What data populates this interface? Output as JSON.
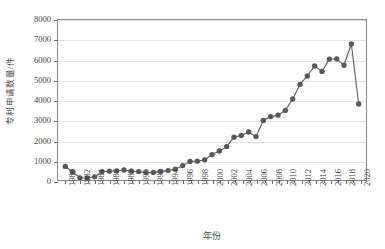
{
  "chart_data": {
    "type": "line",
    "title": "",
    "xlabel": "年份",
    "ylabel": "专利申请数量/件",
    "xlim": [
      1979,
      2021
    ],
    "ylim": [
      0,
      8000
    ],
    "ytick_values": [
      0,
      1000,
      2000,
      3000,
      4000,
      5000,
      6000,
      7000,
      8000
    ],
    "ytick_labels": [
      "0",
      "1000",
      "2000",
      "3000",
      "4000",
      "5000",
      "6000",
      "7000",
      "8000"
    ],
    "xtick_values": [
      1980,
      1982,
      1984,
      1986,
      1988,
      1990,
      1992,
      1994,
      1996,
      1998,
      2000,
      2002,
      2004,
      2006,
      2008,
      2010,
      2012,
      2014,
      2016,
      2018,
      2020
    ],
    "xtick_labels": [
      "1980",
      "1982",
      "1984",
      "1986",
      "1988",
      "1990",
      "1992",
      "1994",
      "1996",
      "1998",
      "2000",
      "2002",
      "2004",
      "2006",
      "2008",
      "2010",
      "2012",
      "2014",
      "2016",
      "2018",
      "2020"
    ],
    "grid": "horizontal",
    "legend": "none",
    "marker": "circle",
    "series_color": "#595959",
    "x": [
      1980,
      1981,
      1982,
      1983,
      1984,
      1985,
      1986,
      1987,
      1988,
      1989,
      1990,
      1991,
      1992,
      1993,
      1994,
      1995,
      1996,
      1997,
      1998,
      1999,
      2000,
      2001,
      2002,
      2003,
      2004,
      2005,
      2006,
      2007,
      2008,
      2009,
      2010,
      2011,
      2012,
      2013,
      2014,
      2015,
      2016,
      2017,
      2018,
      2019,
      2020
    ],
    "values": [
      680,
      400,
      110,
      100,
      160,
      420,
      440,
      460,
      500,
      440,
      420,
      370,
      380,
      430,
      470,
      540,
      720,
      930,
      940,
      1010,
      1270,
      1450,
      1670,
      2140,
      2230,
      2400,
      2170,
      2980,
      3170,
      3240,
      3480,
      4050,
      4780,
      5200,
      5700,
      5430,
      6040,
      6060,
      5740,
      6800,
      3800
    ],
    "series": [
      {
        "name": "专利申请数量",
        "values": [
          680,
          400,
          110,
          100,
          160,
          420,
          440,
          460,
          500,
          440,
          420,
          370,
          380,
          430,
          470,
          540,
          720,
          930,
          940,
          1010,
          1270,
          1450,
          1670,
          2140,
          2230,
          2400,
          2170,
          2980,
          3170,
          3240,
          3480,
          4050,
          4780,
          5200,
          5700,
          5430,
          6040,
          6060,
          5740,
          6800,
          3800
        ]
      }
    ]
  }
}
